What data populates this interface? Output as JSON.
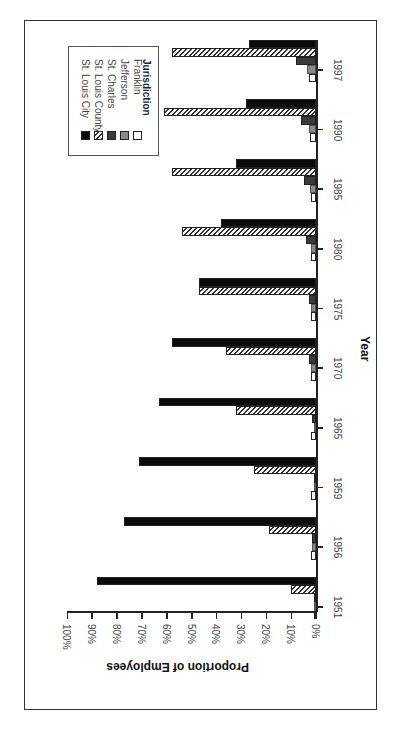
{
  "chart_data": {
    "type": "bar",
    "orientation": "rotated-90-clockwise grouped bar",
    "title": "",
    "xlabel": "Year",
    "ylabel": "Proportion of Employees",
    "ylim": [
      0,
      100
    ],
    "y_ticks": [
      "0%",
      "10%",
      "20%",
      "30%",
      "40%",
      "50%",
      "60%",
      "70%",
      "80%",
      "90%",
      "100%"
    ],
    "grid": false,
    "legend_title": "Jurisdiction",
    "legend_position": "upper-left (in rotated view)",
    "categories": [
      "1951",
      "1956",
      "1959",
      "1965",
      "1970",
      "1975",
      "1980",
      "1985",
      "1990",
      "1997"
    ],
    "series": [
      {
        "name": "Franklin",
        "values": [
          1,
          2,
          2,
          2,
          2,
          2,
          2,
          2,
          2.5,
          3
        ]
      },
      {
        "name": "Jefferson",
        "values": [
          0.5,
          1.5,
          1,
          1,
          2,
          2,
          2,
          2.5,
          3,
          3.5
        ]
      },
      {
        "name": "St. Charles",
        "values": [
          0.5,
          1.5,
          1,
          1.5,
          3,
          3,
          4,
          5,
          6,
          8
        ]
      },
      {
        "name": "St. Louis County",
        "values": [
          10,
          19,
          25,
          32,
          36,
          47,
          54,
          58,
          61,
          58
        ]
      },
      {
        "name": "St. Louis City",
        "values": [
          88,
          77,
          71,
          63,
          58,
          47,
          38,
          32,
          28,
          27
        ]
      }
    ]
  },
  "legend": {
    "title": "Jurisdiction",
    "items": [
      "Franklin",
      "Jefferson",
      "St. Charles",
      "St. Louis County",
      "St. Louis City"
    ]
  },
  "axes": {
    "x_title": "Year",
    "y_title": "Proportion of Employees"
  }
}
